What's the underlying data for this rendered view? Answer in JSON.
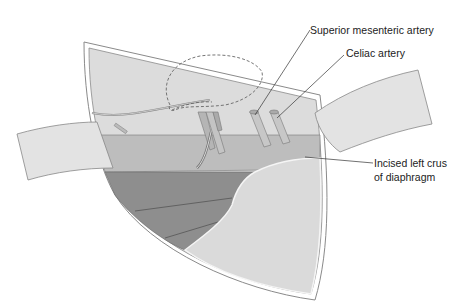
{
  "diagram": {
    "labels": [
      {
        "id": "sma",
        "text": "Superior mesenteric artery"
      },
      {
        "id": "celiac",
        "text": "Celiac artery"
      },
      {
        "id": "crus_line1",
        "text": "Incised left crus"
      },
      {
        "id": "crus_line2",
        "text": "of diaphragm"
      }
    ],
    "colors": {
      "light_tissue": "#dcdcdc",
      "mid_band": "#bdbdbd",
      "dark_region": "#8e8e8e",
      "outline": "#6e6e6e",
      "retractor": "#e3e3e3"
    }
  }
}
